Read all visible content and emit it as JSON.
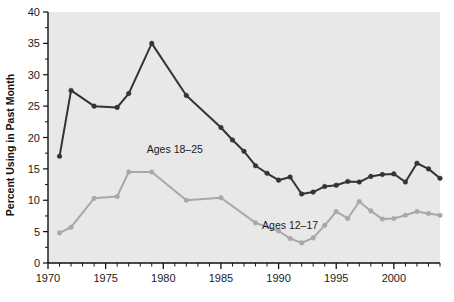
{
  "chart_data": {
    "type": "line",
    "title": "",
    "subtitle": "",
    "xlabel": "",
    "ylabel": "Percent Using in Past Month",
    "xlim": [
      1970,
      2004
    ],
    "ylim": [
      0,
      40
    ],
    "ytick_step": 5,
    "xtick_step": 5,
    "x_minor_tick_step": 1,
    "grid": false,
    "legend_position": "inline-annotations",
    "plot_background": "#e8e8e8",
    "yticks": [
      "0",
      "5",
      "10",
      "15",
      "20",
      "25",
      "30",
      "35",
      "40"
    ],
    "xticks": [
      "1970",
      "1975",
      "1980",
      "1985",
      "1990",
      "1995",
      "2000"
    ],
    "series": [
      {
        "name": "Ages 18-25",
        "label": "Ages 18–25",
        "color": "#333333",
        "marker": "circle",
        "annotation_x": 1981.0,
        "annotation_y": 17.6,
        "x": [
          1971,
          1972,
          1974,
          1976,
          1977,
          1979,
          1982,
          1985,
          1986,
          1987,
          1988,
          1989,
          1990,
          1991,
          1992,
          1993,
          1994,
          1995,
          1996,
          1997,
          1998,
          1999,
          2000,
          2001,
          2002,
          2003,
          2004
        ],
        "values": [
          17.0,
          27.5,
          25.0,
          24.8,
          27.0,
          35.0,
          26.7,
          21.6,
          19.6,
          17.8,
          15.5,
          14.3,
          13.2,
          13.7,
          11.0,
          11.3,
          12.2,
          12.4,
          13.0,
          12.9,
          13.8,
          14.1,
          14.2,
          12.9,
          15.9,
          15.0,
          13.5
        ]
      },
      {
        "name": "Ages 12-17",
        "label": "Ages 12–17",
        "color": "#a8a8a8",
        "marker": "circle",
        "annotation_x": 1991.0,
        "annotation_y": 5.4,
        "x": [
          1971,
          1972,
          1974,
          1976,
          1977,
          1979,
          1982,
          1985,
          1988,
          1990,
          1991,
          1992,
          1993,
          1994,
          1995,
          1996,
          1997,
          1998,
          1999,
          2000,
          2001,
          2002,
          2003,
          2004
        ],
        "values": [
          4.8,
          5.7,
          10.3,
          10.6,
          14.5,
          14.5,
          10.0,
          10.4,
          6.4,
          5.1,
          3.9,
          3.2,
          4.0,
          6.0,
          8.2,
          7.1,
          9.8,
          8.3,
          7.0,
          7.1,
          7.6,
          8.2,
          7.9,
          7.6
        ]
      }
    ]
  }
}
